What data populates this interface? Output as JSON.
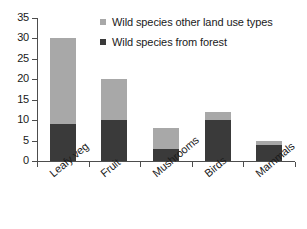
{
  "chart_data": {
    "type": "bar",
    "subtype": "stacked",
    "title": "",
    "xlabel": "",
    "ylabel": "",
    "categories": [
      "Leafy veg",
      "Fruit",
      "Mushrooms",
      "Birds",
      "Mammals"
    ],
    "series": [
      {
        "name": "Wild species from forest",
        "color": "#3a3a3a",
        "values": [
          9,
          10,
          3,
          10,
          4
        ]
      },
      {
        "name": "Wild species other land use types",
        "color": "#a8a8a8",
        "values": [
          21,
          10,
          5,
          2,
          0.8
        ]
      }
    ],
    "totals": [
      30,
      20,
      8,
      12,
      4.8
    ],
    "ylim": [
      0,
      35
    ],
    "yticks": [
      0,
      5,
      10,
      15,
      20,
      25,
      30,
      35
    ],
    "ytick_labels": [
      "0",
      "5",
      "10",
      "15",
      "20",
      "25",
      "30",
      "35"
    ],
    "grid": false,
    "legend_position": "top-right-inside",
    "legend": [
      {
        "label": "Wild species other land use types",
        "swatch": "legend-swatch-other",
        "color": "#a8a8a8"
      },
      {
        "label": "Wild species from forest",
        "swatch": "legend-swatch-forest",
        "color": "#3a3a3a"
      }
    ],
    "axis_color": "#4d4d4d",
    "background": "#ffffff"
  }
}
